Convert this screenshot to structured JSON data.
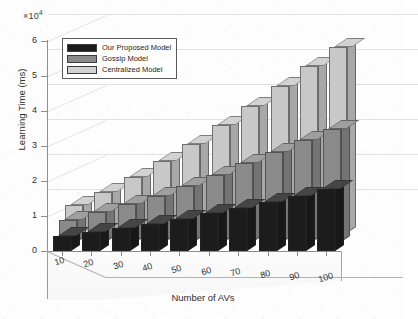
{
  "figure": {
    "exponent_label": "×10",
    "exponent_power": "4"
  },
  "chart_data": {
    "type": "bar",
    "title": "",
    "xlabel": "Number of AVs",
    "ylabel": "Learning Time (ms)",
    "y_multiplier": 10000,
    "y_multiplier_label": "×10⁴",
    "ylim": [
      0,
      6
    ],
    "yticks": [
      0,
      1,
      2,
      3,
      4,
      5,
      6
    ],
    "ytick_labels": [
      "0",
      "1",
      "2",
      "3",
      "4",
      "5",
      "6"
    ],
    "categories": [
      10,
      20,
      30,
      40,
      50,
      60,
      70,
      80,
      90,
      100
    ],
    "xtick_labels": [
      "10",
      "20",
      "30",
      "40",
      "50",
      "60",
      "70",
      "80",
      "90",
      "100"
    ],
    "grid": true,
    "projection": "3d-bar",
    "legend_position": "upper-left",
    "series": [
      {
        "name": "Our Proposed Model",
        "color": "#1c1c1c",
        "row": "front",
        "values": [
          0.42,
          0.55,
          0.66,
          0.78,
          0.92,
          1.08,
          1.22,
          1.4,
          1.58,
          1.78
        ]
      },
      {
        "name": "Gossip Model",
        "color": "#8a8a8a",
        "row": "middle",
        "values": [
          0.62,
          0.85,
          1.08,
          1.32,
          1.6,
          1.92,
          2.25,
          2.58,
          2.92,
          3.22
        ]
      },
      {
        "name": "Centralized Model",
        "color": "#c8c8c8",
        "row": "back",
        "values": [
          0.8,
          1.18,
          1.6,
          2.05,
          2.55,
          3.08,
          3.62,
          4.2,
          4.78,
          5.32
        ]
      }
    ]
  },
  "legend": {
    "items": [
      {
        "label": "Our Proposed Model",
        "color": "#1c1c1c"
      },
      {
        "label": "Gossip Model",
        "color": "#8a8a8a"
      },
      {
        "label": "Centralized Model",
        "color": "#d2d2d2"
      }
    ]
  }
}
